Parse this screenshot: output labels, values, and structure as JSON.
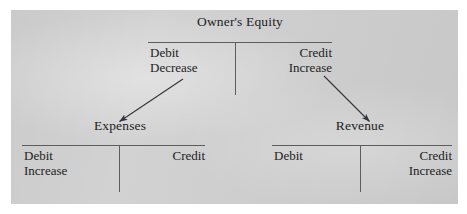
{
  "figure": {
    "kind": "t-account-diagram",
    "plate_color": "#d2d2d2",
    "rule_color": "#5d5d5d",
    "text_color": "#1d1d1d"
  },
  "accounts": {
    "owners_equity": {
      "title": "Owner's Equity",
      "debit_side": {
        "heading": "Debit",
        "effect": "Decrease"
      },
      "credit_side": {
        "heading": "Credit",
        "effect": "Increase"
      }
    },
    "expenses": {
      "title": "Expenses",
      "debit_side": {
        "heading": "Debit",
        "effect": "Increase"
      },
      "credit_side": {
        "heading": "Credit",
        "effect": ""
      }
    },
    "revenue": {
      "title": "Revenue",
      "debit_side": {
        "heading": "Debit",
        "effect": ""
      },
      "credit_side": {
        "heading": "Credit",
        "effect": "Increase"
      }
    }
  },
  "connectors": [
    {
      "id": "oe-debit-to-expenses",
      "from_account": "owners_equity",
      "from_side": "debit",
      "to_account": "expenses",
      "direction": "down-left"
    },
    {
      "id": "oe-credit-to-revenue",
      "from_account": "owners_equity",
      "from_side": "credit",
      "to_account": "revenue",
      "direction": "down-right"
    }
  ]
}
